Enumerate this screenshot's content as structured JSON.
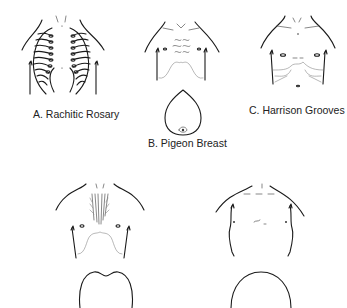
{
  "figure": {
    "panels": [
      {
        "id": "A",
        "label": "A. Rachitic Rosary",
        "torso_icon": "rachitic-rosary-torso"
      },
      {
        "id": "B",
        "label": "B. Pigeon Breast",
        "torso_icon": "pigeon-breast-torso",
        "cross_section_icon": "pigeon-breast-cross-section"
      },
      {
        "id": "C",
        "label": "C. Harrison Grooves",
        "torso_icon": "harrison-grooves-torso"
      },
      {
        "id": "D",
        "label": "",
        "torso_icon": "funnel-chest-torso",
        "cross_section_icon": "funnel-chest-cross-section"
      },
      {
        "id": "E",
        "label": "",
        "torso_icon": "barrel-chest-torso",
        "cross_section_icon": "barrel-chest-cross-section"
      }
    ]
  }
}
